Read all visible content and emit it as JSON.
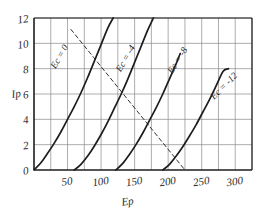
{
  "chart_data": {
    "type": "line",
    "title": "",
    "xlabel": "Ep",
    "ylabel": "Ip",
    "xlim": [
      0,
      325
    ],
    "ylim": [
      0,
      12
    ],
    "grid": true,
    "legend": "inline-curve-labels",
    "x_ticks": [
      50,
      100,
      150,
      200,
      250,
      300
    ],
    "x_tick_labels": [
      "50",
      "100",
      "150",
      "200",
      "250",
      "300"
    ],
    "x_gridline_step": 25,
    "y_ticks": [
      0,
      2,
      4,
      6,
      8,
      10,
      12
    ],
    "y_tick_labels": [
      "0",
      "2",
      "4",
      "6",
      "8",
      "10",
      "12"
    ],
    "y_gridline_step": 2,
    "series": [
      {
        "name": "Ec = 0",
        "label": "Ec = 0",
        "style": "solid",
        "points": [
          [
            0,
            0
          ],
          [
            10,
            0.55
          ],
          [
            20,
            1.3
          ],
          [
            30,
            2.1
          ],
          [
            40,
            3.0
          ],
          [
            50,
            4.0
          ],
          [
            60,
            5.0
          ],
          [
            70,
            6.1
          ],
          [
            80,
            7.3
          ],
          [
            90,
            8.6
          ],
          [
            100,
            9.9
          ],
          [
            110,
            11.2
          ],
          [
            118,
            12.0
          ]
        ]
      },
      {
        "name": "Ec = -4",
        "label": "Ec = -4",
        "style": "solid",
        "points": [
          [
            60,
            0
          ],
          [
            70,
            0.45
          ],
          [
            80,
            1.1
          ],
          [
            90,
            1.9
          ],
          [
            100,
            2.8
          ],
          [
            110,
            3.8
          ],
          [
            120,
            4.9
          ],
          [
            130,
            6.0
          ],
          [
            140,
            7.2
          ],
          [
            150,
            8.5
          ],
          [
            160,
            9.8
          ],
          [
            170,
            11.1
          ],
          [
            178,
            12.0
          ]
        ]
      },
      {
        "name": "Ec = -8",
        "label": "Ec = -8",
        "style": "solid",
        "points": [
          [
            122,
            0
          ],
          [
            132,
            0.5
          ],
          [
            142,
            1.2
          ],
          [
            152,
            2.0
          ],
          [
            162,
            2.9
          ],
          [
            172,
            3.9
          ],
          [
            182,
            4.9
          ],
          [
            192,
            6.0
          ],
          [
            202,
            7.2
          ],
          [
            212,
            8.4
          ],
          [
            218,
            9.2
          ]
        ]
      },
      {
        "name": "Ec = -12",
        "label": "Ec = -12",
        "style": "solid",
        "points": [
          [
            192,
            0
          ],
          [
            202,
            0.45
          ],
          [
            212,
            1.1
          ],
          [
            222,
            1.85
          ],
          [
            232,
            2.7
          ],
          [
            242,
            3.6
          ],
          [
            252,
            4.6
          ],
          [
            262,
            5.6
          ],
          [
            272,
            6.7
          ],
          [
            282,
            7.8
          ],
          [
            290,
            8.0
          ]
        ]
      },
      {
        "name": "load-line",
        "label": "",
        "style": "dashed",
        "points": [
          [
            55,
            11.1
          ],
          [
            225,
            0.0
          ]
        ]
      }
    ]
  },
  "labels": {
    "y_axis_title": "Ip",
    "x_axis_title": "Ep",
    "curve_0": "Ec = 0",
    "curve_1": "Ec = -4",
    "curve_2": "Ec = -8",
    "curve_3": "Ec = -12"
  },
  "colors": {
    "curve": "#1d1d1d",
    "grid": "#8a8a8a",
    "axis": "#1d1d1d",
    "text": "#2b2b2b",
    "background": "#ffffff"
  }
}
